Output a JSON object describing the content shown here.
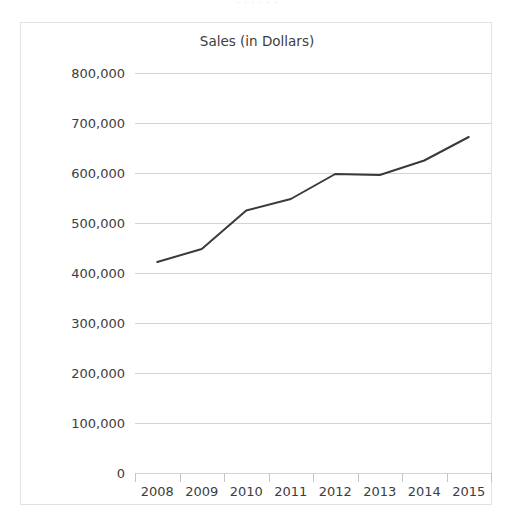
{
  "top_fragment": "· · · · · ·",
  "chart_data": {
    "type": "line",
    "title": "Sales (in Dollars)",
    "xlabel": "",
    "ylabel": "",
    "categories": [
      "2008",
      "2009",
      "2010",
      "2011",
      "2012",
      "2013",
      "2014",
      "2015"
    ],
    "values": [
      422000,
      448000,
      525000,
      548000,
      598000,
      596000,
      625000,
      672000
    ],
    "series": [
      {
        "name": "Sales",
        "values": [
          422000,
          448000,
          525000,
          548000,
          598000,
          596000,
          625000,
          672000
        ]
      }
    ],
    "ylim": [
      0,
      800000
    ],
    "y_ticks": [
      800000,
      700000,
      600000,
      500000,
      400000,
      300000,
      200000,
      100000,
      0
    ],
    "y_tick_labels": [
      "800,000",
      "700,000",
      "600,000",
      "500,000",
      "400,000",
      "300,000",
      "200,000",
      "100,000",
      "0"
    ],
    "grid": true,
    "legend": "none",
    "line_color": "#3a3a3a",
    "line_width": 2,
    "markers": false,
    "gridline_color": "#d4d4d6",
    "background_color": "#ffffff",
    "border_color": "#e2e2e4",
    "text_color": "#3d3d3d"
  }
}
